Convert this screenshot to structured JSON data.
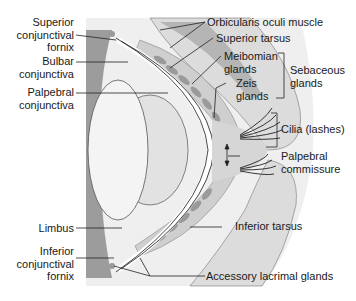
{
  "diagram": {
    "labels_left": [
      {
        "id": "superior-conjunctival-fornix",
        "lines": [
          "Superior",
          "conjunctival",
          "fornix"
        ]
      },
      {
        "id": "bulbar-conjunctiva",
        "lines": [
          "Bulbar",
          "conjunctiva"
        ]
      },
      {
        "id": "palpebral-conjunctiva",
        "lines": [
          "Palpebral",
          "conjunctiva"
        ]
      },
      {
        "id": "limbus",
        "lines": [
          "Limbus"
        ]
      },
      {
        "id": "inferior-conjunctival-fornix",
        "lines": [
          "Inferior",
          "conjunctival",
          "fornix"
        ]
      }
    ],
    "labels_right": [
      {
        "id": "orbicularis-oculi-muscle",
        "lines": [
          "Orbicularis oculi muscle"
        ]
      },
      {
        "id": "superior-tarsus",
        "lines": [
          "Superior tarsus"
        ]
      },
      {
        "id": "meibomian-glands",
        "lines": [
          "Meibomian",
          "glands"
        ]
      },
      {
        "id": "zeis-glands",
        "lines": [
          "Zeis",
          "glands"
        ]
      },
      {
        "id": "sebaceous-glands",
        "lines": [
          "Sebaceous",
          "glands"
        ]
      },
      {
        "id": "cilia",
        "lines": [
          "Cilia (lashes)"
        ]
      },
      {
        "id": "palpebral-commissure",
        "lines": [
          "Palpebral",
          "commissure"
        ]
      },
      {
        "id": "inferior-tarsus",
        "lines": [
          "Inferior tarsus"
        ]
      },
      {
        "id": "accessory-lacrimal-glands",
        "lines": [
          "Accessory lacrimal glands"
        ]
      }
    ],
    "colors": {
      "background": "#ffffff",
      "tissue_light": "#e6e6e6",
      "tissue_mid": "#c8c8c8",
      "tissue_dark": "#9a9a9a",
      "gland": "#a8a8a8",
      "line": "#222222"
    }
  }
}
